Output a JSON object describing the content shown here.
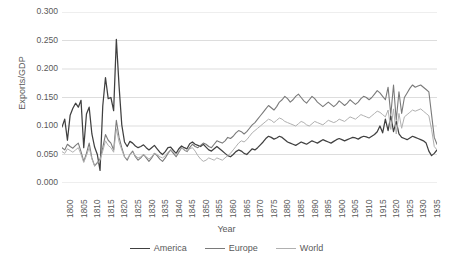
{
  "chart_data": {
    "type": "line",
    "title": "",
    "xlabel": "Year",
    "ylabel": "Exports/GDP",
    "xlim": [
      1800,
      1938
    ],
    "ylim": [
      0.0,
      0.3
    ],
    "grid": true,
    "legend_position": "bottom",
    "y_ticks": [
      "0.000",
      "0.050",
      "0.100",
      "0.150",
      "0.200",
      "0.250",
      "0.300"
    ],
    "y_tick_values": [
      0.0,
      0.05,
      0.1,
      0.15,
      0.2,
      0.25,
      0.3
    ],
    "x_ticks": [
      "1800",
      "1805",
      "1810",
      "1815",
      "1820",
      "1825",
      "1830",
      "1835",
      "1840",
      "1845",
      "1850",
      "1855",
      "1860",
      "1865",
      "1870",
      "1875",
      "1880",
      "1885",
      "1890",
      "1895",
      "1900",
      "1905",
      "1910",
      "1915",
      "1920",
      "1925",
      "1930",
      "1935"
    ],
    "x_tick_values": [
      1800,
      1805,
      1810,
      1815,
      1820,
      1825,
      1830,
      1835,
      1840,
      1845,
      1850,
      1855,
      1860,
      1865,
      1870,
      1875,
      1880,
      1885,
      1890,
      1895,
      1900,
      1905,
      1910,
      1915,
      1920,
      1925,
      1930,
      1935
    ],
    "x_start": 1800,
    "x_step": 1,
    "colors": {
      "America": "#404040",
      "Europe": "#7a7a7a",
      "World": "#b0b0b0",
      "gridline": "#d9d9d9",
      "text": "#595959"
    },
    "series": [
      {
        "name": "America",
        "color": "#404040",
        "width": 1.25,
        "values": [
          0.098,
          0.112,
          0.075,
          0.119,
          0.131,
          0.14,
          0.133,
          0.145,
          0.062,
          0.121,
          0.133,
          0.086,
          0.063,
          0.05,
          0.022,
          0.135,
          0.185,
          0.148,
          0.15,
          0.127,
          0.252,
          0.17,
          0.102,
          0.072,
          0.064,
          0.073,
          0.07,
          0.065,
          0.062,
          0.064,
          0.067,
          0.062,
          0.058,
          0.062,
          0.066,
          0.06,
          0.054,
          0.05,
          0.055,
          0.062,
          0.063,
          0.057,
          0.052,
          0.06,
          0.065,
          0.062,
          0.06,
          0.069,
          0.072,
          0.068,
          0.066,
          0.064,
          0.068,
          0.063,
          0.058,
          0.056,
          0.06,
          0.064,
          0.06,
          0.056,
          0.052,
          0.048,
          0.046,
          0.05,
          0.055,
          0.058,
          0.056,
          0.052,
          0.05,
          0.055,
          0.06,
          0.058,
          0.062,
          0.067,
          0.072,
          0.078,
          0.082,
          0.08,
          0.077,
          0.079,
          0.082,
          0.08,
          0.076,
          0.072,
          0.07,
          0.068,
          0.066,
          0.069,
          0.072,
          0.07,
          0.068,
          0.071,
          0.074,
          0.072,
          0.07,
          0.073,
          0.076,
          0.074,
          0.072,
          0.07,
          0.073,
          0.076,
          0.078,
          0.076,
          0.074,
          0.076,
          0.078,
          0.08,
          0.079,
          0.077,
          0.08,
          0.082,
          0.081,
          0.079,
          0.082,
          0.085,
          0.09,
          0.1,
          0.088,
          0.112,
          0.092,
          0.118,
          0.09,
          0.108,
          0.086,
          0.08,
          0.078,
          0.076,
          0.079,
          0.082,
          0.08,
          0.078,
          0.076,
          0.074,
          0.07,
          0.056,
          0.048,
          0.052,
          0.058,
          0.052,
          0.06,
          0.054,
          0.062
        ]
      },
      {
        "name": "Europe",
        "color": "#7a7a7a",
        "width": 1.1,
        "values": [
          0.062,
          0.058,
          0.068,
          0.064,
          0.061,
          0.066,
          0.07,
          0.055,
          0.038,
          0.052,
          0.07,
          0.044,
          0.03,
          0.036,
          0.042,
          0.062,
          0.085,
          0.075,
          0.07,
          0.058,
          0.11,
          0.08,
          0.062,
          0.046,
          0.04,
          0.05,
          0.056,
          0.046,
          0.04,
          0.044,
          0.05,
          0.044,
          0.038,
          0.044,
          0.052,
          0.048,
          0.042,
          0.038,
          0.044,
          0.052,
          0.058,
          0.052,
          0.046,
          0.054,
          0.062,
          0.058,
          0.055,
          0.062,
          0.068,
          0.064,
          0.062,
          0.066,
          0.07,
          0.068,
          0.064,
          0.062,
          0.068,
          0.074,
          0.072,
          0.07,
          0.074,
          0.08,
          0.078,
          0.082,
          0.088,
          0.092,
          0.09,
          0.086,
          0.09,
          0.096,
          0.102,
          0.106,
          0.112,
          0.118,
          0.124,
          0.13,
          0.136,
          0.132,
          0.128,
          0.134,
          0.142,
          0.146,
          0.152,
          0.148,
          0.142,
          0.146,
          0.152,
          0.156,
          0.15,
          0.144,
          0.14,
          0.146,
          0.152,
          0.148,
          0.142,
          0.138,
          0.134,
          0.138,
          0.142,
          0.138,
          0.134,
          0.138,
          0.144,
          0.14,
          0.136,
          0.14,
          0.146,
          0.142,
          0.138,
          0.142,
          0.148,
          0.152,
          0.15,
          0.146,
          0.15,
          0.156,
          0.162,
          0.158,
          0.152,
          0.146,
          0.168,
          0.12,
          0.172,
          0.11,
          0.16,
          0.122,
          0.15,
          0.158,
          0.166,
          0.172,
          0.168,
          0.17,
          0.172,
          0.168,
          0.164,
          0.16,
          0.12,
          0.08,
          0.068,
          0.062,
          0.058,
          0.064,
          0.06,
          0.066
        ]
      },
      {
        "name": "World",
        "color": "#b0b0b0",
        "width": 1.0,
        "values": [
          0.055,
          0.052,
          0.06,
          0.057,
          0.054,
          0.058,
          0.062,
          0.05,
          0.036,
          0.048,
          0.062,
          0.042,
          0.03,
          0.034,
          0.04,
          0.056,
          0.074,
          0.066,
          0.062,
          0.054,
          0.095,
          0.072,
          0.058,
          0.046,
          0.042,
          0.05,
          0.054,
          0.048,
          0.044,
          0.046,
          0.05,
          0.046,
          0.042,
          0.046,
          0.052,
          0.05,
          0.046,
          0.044,
          0.048,
          0.054,
          0.058,
          0.054,
          0.05,
          0.056,
          0.062,
          0.058,
          0.056,
          0.06,
          0.062,
          0.056,
          0.048,
          0.042,
          0.038,
          0.04,
          0.044,
          0.042,
          0.04,
          0.044,
          0.042,
          0.04,
          0.044,
          0.048,
          0.052,
          0.058,
          0.064,
          0.07,
          0.074,
          0.072,
          0.076,
          0.082,
          0.088,
          0.092,
          0.096,
          0.1,
          0.104,
          0.108,
          0.112,
          0.11,
          0.106,
          0.11,
          0.114,
          0.112,
          0.108,
          0.106,
          0.104,
          0.102,
          0.1,
          0.104,
          0.108,
          0.106,
          0.102,
          0.1,
          0.104,
          0.108,
          0.106,
          0.104,
          0.102,
          0.106,
          0.11,
          0.108,
          0.106,
          0.108,
          0.112,
          0.11,
          0.108,
          0.112,
          0.116,
          0.114,
          0.112,
          0.116,
          0.12,
          0.118,
          0.116,
          0.114,
          0.118,
          0.122,
          0.126,
          0.124,
          0.12,
          0.116,
          0.128,
          0.094,
          0.13,
          0.086,
          0.122,
          0.096,
          0.116,
          0.12,
          0.124,
          0.128,
          0.126,
          0.128,
          0.13,
          0.126,
          0.122,
          0.118,
          0.094,
          0.064,
          0.058,
          0.054,
          0.05,
          0.056,
          0.052,
          0.058
        ]
      }
    ]
  },
  "legend": {
    "items": [
      {
        "label": "America"
      },
      {
        "label": "Europe"
      },
      {
        "label": "World"
      }
    ]
  }
}
